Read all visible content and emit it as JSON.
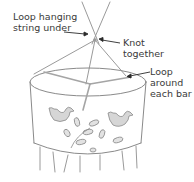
{
  "diagram": {
    "labels": [
      {
        "id": "loop-hanging",
        "lines": [
          "Loop hanging",
          "string under"
        ]
      },
      {
        "id": "knot",
        "lines": [
          "Knot",
          "together"
        ]
      },
      {
        "id": "loop-bar",
        "lines": [
          "Loop",
          "around",
          "each bar"
        ]
      }
    ],
    "colors": {
      "line": "#9a9a9a",
      "outline": "#8a8a8a",
      "text": "#3a3a3a",
      "fill_motif": "#d6d6d6",
      "arrow": "#2a2a2a"
    }
  }
}
